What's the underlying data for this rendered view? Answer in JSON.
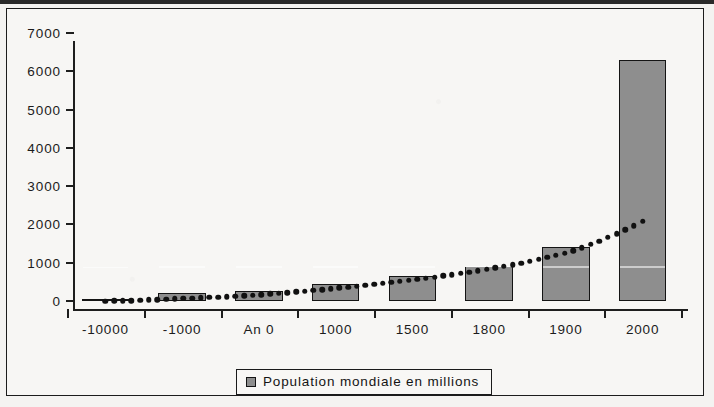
{
  "chart_data": {
    "type": "bar",
    "title": "",
    "xlabel": "",
    "ylabel": "",
    "categories": [
      "-10000",
      "-1000",
      "An 0",
      "1000",
      "1500",
      "1800",
      "1900",
      "2000"
    ],
    "values": [
      50,
      200,
      250,
      450,
      650,
      900,
      1400,
      6300
    ],
    "series": [
      {
        "name": "Population mondiale en millions",
        "type": "bar",
        "values": [
          50,
          200,
          250,
          450,
          650,
          900,
          1400,
          6300
        ]
      },
      {
        "name": "trendline",
        "type": "scatter-dotted",
        "values": [
          60,
          130,
          230,
          400,
          620,
          900,
          1320,
          2150
        ]
      }
    ],
    "ylim": [
      0,
      7000
    ],
    "y_ticks": [
      0,
      1000,
      2000,
      3000,
      4000,
      5000,
      6000,
      7000
    ],
    "y_tick_labels": [
      "0",
      "1000",
      "2000",
      "3000",
      "4000",
      "5000",
      "6000",
      "7000"
    ],
    "grid": false,
    "legend_position": "bottom",
    "legend_entries": [
      "Population mondiale en millions"
    ],
    "colors": {
      "bar_fill": "#8e8e8e",
      "bar_border": "#141414",
      "axis": "#1e1e1e",
      "trendline": "#111111",
      "background": "#f7f6f4"
    }
  },
  "legend": {
    "label": "Population mondiale en millions"
  }
}
